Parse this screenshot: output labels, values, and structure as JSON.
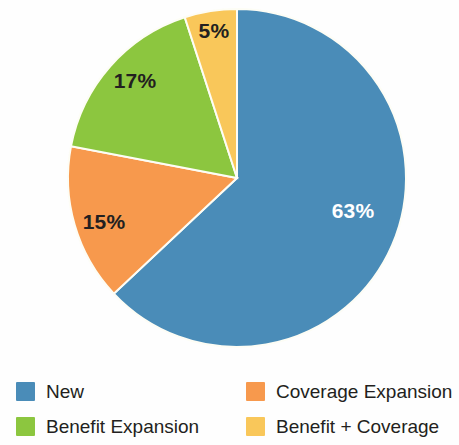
{
  "chart_data": {
    "type": "pie",
    "title": "",
    "subtitle": "",
    "xlabel": "",
    "ylabel": "",
    "grid": false,
    "legend_position": "bottom",
    "start_angle_deg": 0,
    "direction": "clockwise",
    "center": {
      "x": 237,
      "y": 178
    },
    "radius": 169,
    "categories": [
      "New",
      "Coverage Expansion",
      "Benefit Expansion",
      "Benefit + Coverage"
    ],
    "values": [
      63,
      15,
      17,
      5
    ],
    "value_unit": "%",
    "data_labels": [
      "63%",
      "15%",
      "17%",
      "5%"
    ],
    "colors": [
      "#4a8cb8",
      "#f7994d",
      "#8cc63f",
      "#f9c75a"
    ],
    "slices": [
      {
        "name": "New",
        "value": 63,
        "label": "63%",
        "color": "#4a8cb8",
        "label_color": "#ffffff",
        "label_x": 353,
        "label_y": 211
      },
      {
        "name": "Coverage Expansion",
        "value": 15,
        "label": "15%",
        "color": "#f7994d",
        "label_color": "#231f20",
        "label_x": 104,
        "label_y": 222
      },
      {
        "name": "Benefit Expansion",
        "value": 17,
        "label": "17%",
        "color": "#8cc63f",
        "label_color": "#231f20",
        "label_x": 135,
        "label_y": 81
      },
      {
        "name": "Benefit + Coverage",
        "value": 5,
        "label": "5%",
        "color": "#f9c75a",
        "label_color": "#231f20",
        "label_x": 214,
        "label_y": 31
      }
    ]
  },
  "legend": {
    "items": [
      {
        "label": "New",
        "color": "#4a8cb8"
      },
      {
        "label": "Coverage Expansion",
        "color": "#f7994d"
      },
      {
        "label": "Benefit Expansion",
        "color": "#8cc63f"
      },
      {
        "label": "Benefit + Coverage",
        "color": "#f9c75a"
      }
    ]
  }
}
